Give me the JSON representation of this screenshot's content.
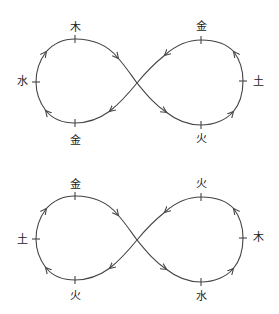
{
  "diagrams": [
    {
      "id": "top",
      "labels": {
        "left_top": "木",
        "left_left": "水",
        "left_bottom": "金",
        "right_top": "金",
        "right_right": "土",
        "right_bottom": "火"
      }
    },
    {
      "id": "bottom",
      "labels": {
        "left_top": "金",
        "left_left": "土",
        "left_bottom": "火",
        "right_top": "火",
        "right_right": "木",
        "right_bottom": "水"
      }
    }
  ],
  "style": {
    "stroke_color": "#444444",
    "text_color": "#222222"
  }
}
